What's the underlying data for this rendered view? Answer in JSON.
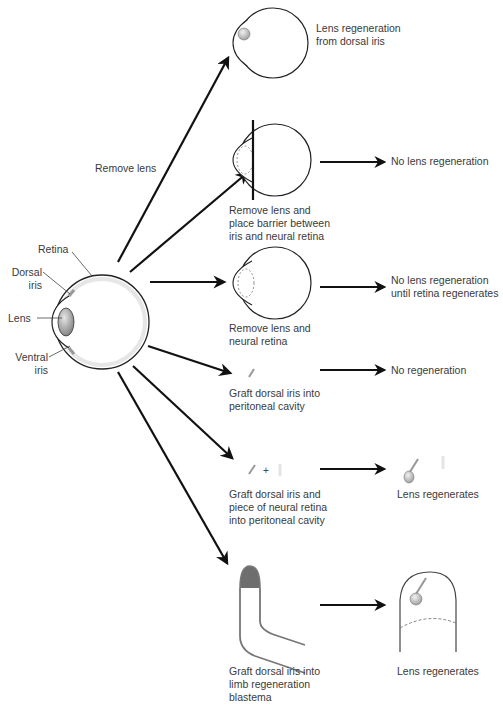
{
  "main_eye": {
    "labels": {
      "retina": "Retina",
      "dorsal_iris": "Dorsal\niris",
      "lens": "Lens",
      "ventral_iris": "Ventral\niris"
    }
  },
  "arrow_label": "Remove lens",
  "experiments": [
    {
      "procedure": "",
      "outcome": "Lens regeneration\nfrom dorsal iris"
    },
    {
      "procedure": "Remove lens and\nplace barrier between\niris and neural retina",
      "outcome": "No lens regeneration"
    },
    {
      "procedure": "Remove lens and\nneural retina",
      "outcome": "No lens regeneration\nuntil retina regenerates"
    },
    {
      "procedure": "Graft dorsal iris into\nperitoneal cavity",
      "outcome": "No regeneration"
    },
    {
      "procedure": "Graft dorsal iris and\npiece of neural retina\ninto peritoneal cavity",
      "outcome": "Lens regenerates"
    },
    {
      "procedure": "Graft dorsal iris into\nlimb regeneration\nblastema",
      "outcome": "Lens regenerates"
    }
  ],
  "plus_sign": "+",
  "colors": {
    "outline": "#222222",
    "iris_gray": "#9a9a9a",
    "retina_band": "#e4e4e4",
    "lens_dark": "#7a7a7a",
    "blastema_cap": "#6e6e6e"
  }
}
